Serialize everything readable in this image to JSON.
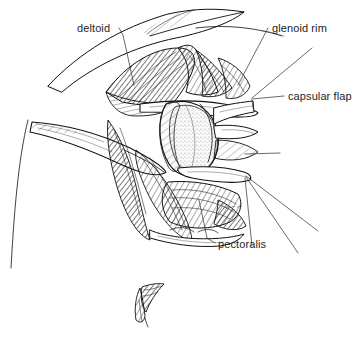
{
  "figure": {
    "width": 362,
    "height": 343,
    "background_color": "#ffffff",
    "ink_color": "#111111",
    "label_color": "#221f1f"
  },
  "labels": [
    {
      "id": "deltoid",
      "text": "deltoid",
      "x": 77,
      "y": 32,
      "anchor": "start",
      "leader": "M 119 28 L 123 35 L 134 85"
    },
    {
      "id": "glenoid-rim",
      "text": "glenoid rim",
      "x": 272,
      "y": 32,
      "anchor": "start",
      "leader": "M 268 28 L 238 85"
    },
    {
      "id": "capsular-flap",
      "text": "capsular flap",
      "x": 288,
      "y": 100,
      "anchor": "start",
      "leader": "M 284 96 L 252 99"
    },
    {
      "id": "pectoralis",
      "text": "pectoralis",
      "x": 218,
      "y": 248,
      "anchor": "start",
      "leader": "M 215 243 L 207 238 L 199 200"
    }
  ],
  "leader_lines_extra": [
    {
      "id": "glenoid-rim-second",
      "path": "M 312 48 L 252 98"
    },
    {
      "id": "capsular-flap-lower",
      "path": "M 252 100 L 253 108"
    },
    {
      "id": "subscapularis-upper",
      "path": "M 280 153 L 245 154"
    },
    {
      "id": "lower-fan-1",
      "path": "M 246 176 L 318 231"
    },
    {
      "id": "lower-fan-2",
      "path": "M 246 177 L 298 253"
    },
    {
      "id": "lower-fan-3",
      "path": "M 245 178 L 252 246"
    }
  ],
  "structures": [
    {
      "id": "skin-edge-superior",
      "name": "superior skin and fascia edge"
    },
    {
      "id": "deltoid-muscle",
      "name": "deltoid muscle belly, hatched"
    },
    {
      "id": "glenoid-face",
      "name": "glenoid articular surface, stippled oval"
    },
    {
      "id": "capsular-flap-tissue",
      "name": "reflected capsular flap"
    },
    {
      "id": "retractor-superior",
      "name": "superior retractor blade"
    },
    {
      "id": "retractor-left",
      "name": "left retractor blade"
    },
    {
      "id": "retractor-inferior",
      "name": "inferior retractor blade"
    },
    {
      "id": "pectoralis-muscle",
      "name": "pectoralis major, hatched"
    },
    {
      "id": "body-contour-left",
      "name": "left body contour line"
    },
    {
      "id": "tissue-fragment",
      "name": "detached hatched tissue fragment"
    },
    {
      "id": "artist-signature",
      "name": "artist signature mark"
    }
  ]
}
